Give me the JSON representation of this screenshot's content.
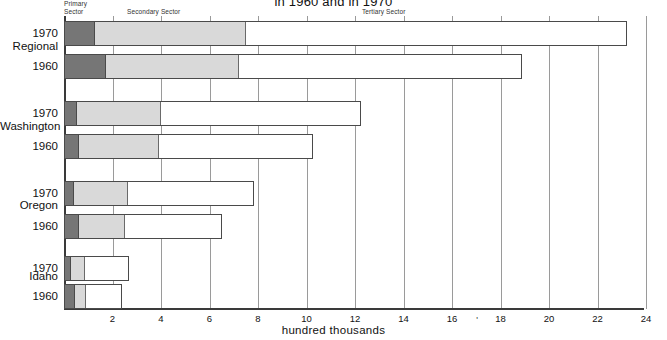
{
  "title": {
    "line1": "",
    "line2": "in 1960 and in 1970"
  },
  "legend": {
    "primary": "Primary\nSector",
    "secondary": "Secondary Sector",
    "tertiary": "Tertiary Sector"
  },
  "axis": {
    "x_title": "hundred thousands",
    "x_ticks": [
      "2",
      "4",
      "6",
      "8",
      "10",
      "12",
      "14",
      "16",
      "18",
      "20",
      "22",
      "24"
    ],
    "x_min": 0,
    "x_max": 24,
    "stray_mark": "'"
  },
  "groups": [
    {
      "name": "Regional",
      "label": "Regional"
    },
    {
      "name": "Washington",
      "label": "Washington"
    },
    {
      "name": "Oregon",
      "label": "Oregon"
    },
    {
      "name": "Idaho",
      "label": "Idaho"
    }
  ],
  "year_labels": {
    "y1970": "1970",
    "y1960": "1960"
  },
  "colors": {
    "primary": "#767676",
    "secondary": "#d9d9d9",
    "tertiary": "#ffffff",
    "axis": "#3a3a3a",
    "grid": "#9a9a9a"
  },
  "chart_data": {
    "type": "bar",
    "orientation": "horizontal",
    "stacked": true,
    "title": "in 1960 and in 1970",
    "xlabel": "hundred thousands",
    "ylabel": "",
    "xlim": [
      0,
      24
    ],
    "grid": true,
    "legend_position": "top",
    "series": [
      {
        "name": "Primary Sector",
        "color": "#767676"
      },
      {
        "name": "Secondary Sector",
        "color": "#d9d9d9"
      },
      {
        "name": "Tertiary Sector",
        "color": "#ffffff"
      }
    ],
    "categories": [
      "Regional 1970",
      "Regional 1960",
      "Washington 1970",
      "Washington 1960",
      "Oregon 1970",
      "Oregon 1960",
      "Idaho 1970",
      "Idaho 1960"
    ],
    "bars": [
      {
        "group": "Regional",
        "year": "1970",
        "primary": 1.25,
        "secondary": 6.25,
        "tertiary": 15.7,
        "total": 23.2
      },
      {
        "group": "Regional",
        "year": "1960",
        "primary": 1.7,
        "secondary": 5.5,
        "tertiary": 11.7,
        "total": 18.9
      },
      {
        "group": "Washington",
        "year": "1970",
        "primary": 0.5,
        "secondary": 3.5,
        "tertiary": 8.25,
        "total": 12.25
      },
      {
        "group": "Washington",
        "year": "1960",
        "primary": 0.58,
        "secondary": 3.32,
        "tertiary": 6.35,
        "total": 10.25
      },
      {
        "group": "Oregon",
        "year": "1970",
        "primary": 0.38,
        "secondary": 2.25,
        "tertiary": 5.22,
        "total": 7.85
      },
      {
        "group": "Oregon",
        "year": "1960",
        "primary": 0.58,
        "secondary": 1.92,
        "tertiary": 4.0,
        "total": 6.5
      },
      {
        "group": "Idaho",
        "year": "1970",
        "primary": 0.25,
        "secondary": 0.6,
        "tertiary": 1.85,
        "total": 2.7
      },
      {
        "group": "Idaho",
        "year": "1960",
        "primary": 0.42,
        "secondary": 0.47,
        "tertiary": 1.51,
        "total": 2.4
      }
    ]
  }
}
